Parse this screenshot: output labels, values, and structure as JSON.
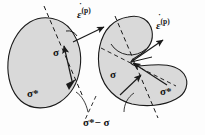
{
  "figure": {
    "title": "",
    "type": "mechanics-yield-surface-normality-diagram",
    "background_color": "#fdfdfd",
    "shape_fill_color": "#d9d9d9",
    "shape_stroke_color": "#1a1a1a",
    "line_color": "#1a1a1a"
  },
  "labels": {
    "strain_rate_left": {
      "symbol": "ε",
      "dot": "̇",
      "superscript": "(p)",
      "text": "ε̇ (p)"
    },
    "strain_rate_right": {
      "symbol": "ε",
      "dot": "̇",
      "superscript": "(p)",
      "text": "ε̇ (p)"
    },
    "sigma_left": "σ",
    "sigma_star_left": "σ*",
    "sigma_right": "σ",
    "sigma_star_right": "σ*",
    "difference": "σ*− σ",
    "difference_parts": {
      "sigma_star": "σ*",
      "minus": "−",
      "sigma": "σ"
    }
  },
  "shapes": [
    {
      "name": "convex-yield-surface",
      "position": "left",
      "convexity": "convex",
      "fill": "#d9d9d9",
      "stroke": "#1a1a1a"
    },
    {
      "name": "nonconvex-yield-surface",
      "position": "right",
      "convexity": "non-convex",
      "fill": "#d9d9d9",
      "stroke": "#1a1a1a"
    }
  ],
  "annotations": {
    "tangent_line_style": "dashed",
    "strain_rate_arrow_style": "solid-filled-head",
    "difference_vector_style": "solid-filled-head",
    "angle_marker_left": "acute",
    "angle_marker_right": "obtuse"
  }
}
